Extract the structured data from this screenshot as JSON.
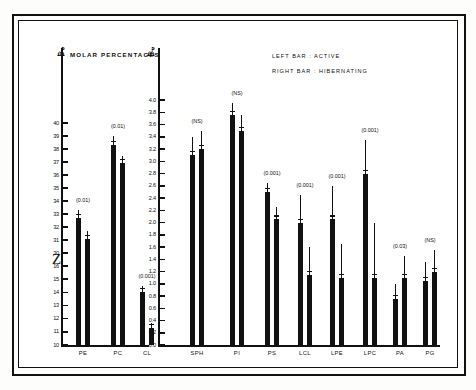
{
  "figure": {
    "title": "MOLAR   PERCENTAGES",
    "legend": [
      "LEFT  BAR :  ACTIVE",
      "RIGHT  BAR :  HIBERNATING"
    ]
  },
  "chart_data": {
    "type": "bar",
    "title": "MOLAR PERCENTAGES",
    "xlabel": "",
    "ylabel": "Molar percentage",
    "orientation": "vertical",
    "grid": false,
    "legend_position": "top-right",
    "error_bars": "standard deviation",
    "panels": [
      {
        "name": "left-panel",
        "axis": {
          "label": "MOLAR PERCENTAGES",
          "broken": true,
          "segments": [
            {
              "ticks": [
                40,
                39,
                38,
                37,
                36,
                35,
                34,
                33,
                32,
                31,
                30
              ]
            },
            {
              "ticks": [
                16,
                15,
                14,
                13,
                12,
                11,
                10
              ]
            }
          ],
          "ylim": [
            10,
            40
          ]
        },
        "categories": [
          "PE",
          "PC",
          "CL"
        ],
        "pvalues": [
          "(0.01)",
          "(0.01)",
          "(0.001)"
        ],
        "series": [
          {
            "name": "ACTIVE",
            "values": [
              32.7,
              38.3,
              14.0
            ],
            "errors": [
              0.6,
              0.7,
              0.5
            ]
          },
          {
            "name": "HIBERNATING",
            "values": [
              31.1,
              36.9,
              11.3
            ],
            "errors": [
              0.6,
              0.6,
              0.4
            ]
          }
        ]
      },
      {
        "name": "right-panel",
        "axis": {
          "ticks": [
            4.0,
            3.8,
            3.6,
            3.4,
            3.2,
            3.0,
            2.8,
            2.6,
            2.4,
            2.2,
            2.0,
            1.8,
            1.6,
            1.4,
            1.2,
            1.0,
            0.8,
            0.6,
            0.4,
            0.2,
            0.0
          ],
          "ylim": [
            0.0,
            4.0
          ],
          "broken": false
        },
        "categories": [
          "SPH",
          "PI",
          "PS",
          "LCL",
          "LPE",
          "LPC",
          "PA",
          "PG"
        ],
        "pvalues": [
          "(NS)",
          "(NS)",
          "(0.001)",
          "(0.001)",
          "(0.001)",
          "(0.001)",
          "(0.03)",
          "(NS)"
        ],
        "series": [
          {
            "name": "ACTIVE",
            "values": [
              3.1,
              3.75,
              2.5,
              2.0,
              2.05,
              2.8,
              0.75,
              1.05
            ],
            "errors": [
              0.3,
              0.2,
              0.15,
              0.45,
              0.55,
              0.55,
              0.25,
              0.3
            ]
          },
          {
            "name": "HIBERNATING",
            "values": [
              3.2,
              3.5,
              2.05,
              1.15,
              1.1,
              1.1,
              1.1,
              1.2
            ],
            "errors": [
              0.3,
              0.25,
              0.2,
              0.45,
              0.55,
              0.9,
              0.35,
              0.35
            ]
          }
        ]
      }
    ]
  },
  "axis_left_upper_labels": [
    "40",
    "39",
    "38",
    "37",
    "36",
    "35",
    "34",
    "33",
    "32",
    "31",
    "30"
  ],
  "axis_left_lower_labels": [
    "16",
    "15",
    "14",
    "13",
    "12",
    "11",
    "10"
  ],
  "axis_right_labels": [
    "4.0",
    "3.8",
    "3.6",
    "3.4",
    "3.2",
    "3.0",
    "2.8",
    "2.6",
    "2.4",
    "2.2",
    "2.0",
    "1.8",
    "1.6",
    "1.4",
    "1.2",
    "1.0",
    "0.8",
    "0.6",
    "0.4",
    "0.2",
    "0.0"
  ],
  "categories_left": [
    "PE",
    "PC",
    "CL"
  ],
  "categories_right": [
    "SPH",
    "PI",
    "PS",
    "LCL",
    "LPE",
    "LPC",
    "PA",
    "PG"
  ],
  "pvalues_left": [
    "(0.01)",
    "(0.01)",
    "(0.001)"
  ],
  "pvalues_right": [
    "(NS)",
    "(NS)",
    "(0.001)",
    "(0.001)",
    "(0.001)",
    "(0.001)",
    "(0.03)",
    "(NS)"
  ],
  "arrow_left": "⬌",
  "arrow_right": "⬌",
  "break_glyph": "⸻"
}
